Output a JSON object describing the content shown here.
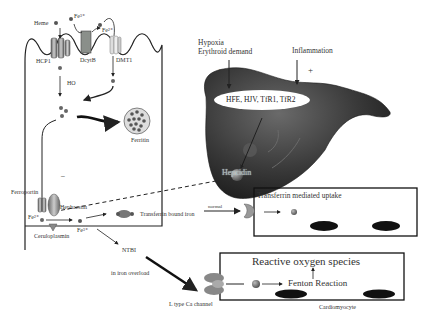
{
  "diagram": {
    "enterocyte": {
      "heme_label": "Heme",
      "fe3_label": "Fe³⁺",
      "fe2_label": "Fe²⁺",
      "hcp1_label": "HCP1",
      "dcytb_label": "DcytB",
      "dmt1_label": "DMT1",
      "ho_label": "HO",
      "ferritin_label": "Ferritin",
      "minus_label": "–",
      "ferroportin_label": "Ferroportin",
      "hephaestin_label": "Hephaestin",
      "fe2_out_label": "Fe²⁺",
      "ceruloplasmin_label": "Ceruloplasmin",
      "fe3_out_label": "Fe³⁺"
    },
    "liver": {
      "hypoxia_label": "Hypoxia",
      "erythroid_label": "Erythroid demand",
      "inflammation_label": "Inflammation",
      "minus_label": "–",
      "plus_label": "+",
      "genes_label": "HFE, HJV, TfR1, TfR2",
      "hepcidin_label": "Hepcidin"
    },
    "circulation": {
      "transferrin_bound_label": "Transferrin bound iron",
      "normal_label": "normal",
      "ntbi_label": "NTBI",
      "overload_label": "in iron overload"
    },
    "transferrin_box": {
      "title": "Transferrin mediated uptake"
    },
    "cardio_box": {
      "ros_label": "Reactive oxygen species",
      "fenton_label": "Fenton Reaction",
      "channel_label": "L type Ca channel",
      "cell_label": "Cardiomyocyte"
    },
    "colors": {
      "line": "#222222",
      "liver_dark": "#2e2e2e",
      "liver_mid": "#555555",
      "protein_gray": "#8a8a8a",
      "dot_gray": "#6a6a6a",
      "ferritin_fill": "#d8d8d8"
    }
  }
}
